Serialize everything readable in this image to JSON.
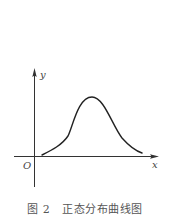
{
  "figure": {
    "axes": {
      "x_label": "x",
      "y_label": "y",
      "origin_label": "O"
    },
    "curve": {
      "description": "bell-shaped normal distribution curve",
      "path": "M42,155 C52,150 62,145 68,136 C73,126 78,97 92,97 C104,97 112,125 122,138 C130,147 136,151 142,153"
    },
    "caption": {
      "figure_number": "图 2",
      "title": "正态分布曲线图"
    },
    "colors": {
      "axis": "#333333",
      "curve": "#222222",
      "caption": "#555555"
    }
  }
}
